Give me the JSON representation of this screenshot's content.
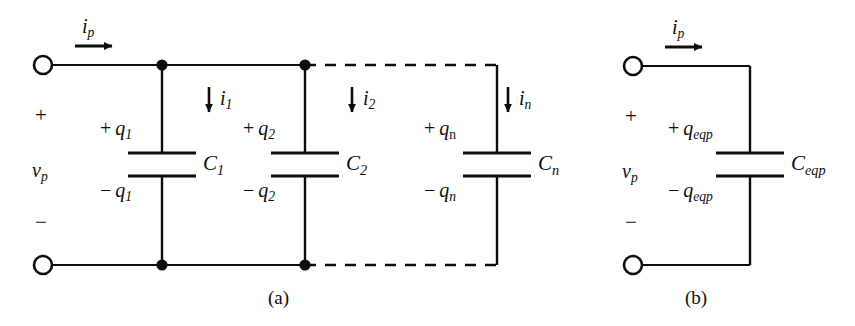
{
  "figure": {
    "background_color": "#ffffff",
    "ink_color": "#0d0d0d"
  },
  "panels": [
    {
      "id": "a",
      "caption": "(a)",
      "port": {
        "current_label_base": "i",
        "current_label_sub": "p",
        "plus_sign": "+",
        "minus_sign": "−",
        "voltage_base": "v",
        "voltage_sub": "p"
      },
      "branches": [
        {
          "id": "branch-1",
          "branch_current_base": "i",
          "branch_current_sub": "1",
          "charge_top_sign": "+",
          "charge_top_base": "q",
          "charge_top_sub": "1",
          "charge_bottom_sign": "−",
          "charge_bottom_base": "q",
          "charge_bottom_sub": "1",
          "capacitor_base": "C",
          "capacitor_sub": "1",
          "subscript_style": "italic"
        },
        {
          "id": "branch-2",
          "branch_current_base": "i",
          "branch_current_sub": "2",
          "charge_top_sign": "+",
          "charge_top_base": "q",
          "charge_top_sub": "2",
          "charge_bottom_sign": "−",
          "charge_bottom_base": "q",
          "charge_bottom_sub": "2",
          "capacitor_base": "C",
          "capacitor_sub": "2",
          "subscript_style": "italic"
        },
        {
          "id": "branch-n",
          "branch_current_base": "i",
          "branch_current_sub": "n",
          "charge_top_sign": "+",
          "charge_top_base": "q",
          "charge_top_sub": "n",
          "charge_bottom_sign": "−",
          "charge_bottom_base": "q",
          "charge_bottom_sub": "n",
          "capacitor_base": "C",
          "capacitor_sub": "n",
          "subscript_style": "roman-top-italic-bottom"
        }
      ]
    },
    {
      "id": "b",
      "caption": "(b)",
      "port": {
        "current_label_base": "i",
        "current_label_sub": "p",
        "plus_sign": "+",
        "minus_sign": "−",
        "voltage_base": "v",
        "voltage_sub": "p"
      },
      "branches": [
        {
          "id": "branch-eqp",
          "charge_top_sign": "+",
          "charge_top_base": "q",
          "charge_top_sub": "eqp",
          "charge_bottom_sign": "−",
          "charge_bottom_base": "q",
          "charge_bottom_sub": "eqp",
          "capacitor_base": "C",
          "capacitor_sub": "eqp",
          "subscript_style": "italic"
        }
      ]
    }
  ]
}
